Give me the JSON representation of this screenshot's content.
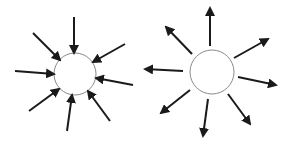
{
  "diagram": {
    "colors": {
      "arrow": "#1a1a1a",
      "circle_stroke": "#8a8a8a",
      "background": "#ffffff"
    },
    "panels": [
      {
        "name": "inward-converging",
        "circle": {
          "cx": 75,
          "cy": 74,
          "r": 21
        },
        "direction": "inward",
        "arrows": [
          {
            "x1": 74,
            "y1": 17,
            "x2": 74,
            "y2": 53
          },
          {
            "x1": 33,
            "y1": 33,
            "x2": 60,
            "y2": 60
          },
          {
            "x1": 125,
            "y1": 44,
            "x2": 93,
            "y2": 62
          },
          {
            "x1": 15,
            "y1": 71,
            "x2": 54,
            "y2": 74
          },
          {
            "x1": 133,
            "y1": 85,
            "x2": 96,
            "y2": 78
          },
          {
            "x1": 29,
            "y1": 111,
            "x2": 59,
            "y2": 89
          },
          {
            "x1": 67,
            "y1": 131,
            "x2": 72,
            "y2": 95
          },
          {
            "x1": 110,
            "y1": 121,
            "x2": 88,
            "y2": 91
          }
        ]
      },
      {
        "name": "outward-diverging",
        "circle": {
          "cx": 212,
          "cy": 72,
          "r": 22
        },
        "direction": "outward",
        "arrows": [
          {
            "x1": 210,
            "y1": 46,
            "x2": 210,
            "y2": 8
          },
          {
            "x1": 192,
            "y1": 54,
            "x2": 166,
            "y2": 27
          },
          {
            "x1": 234,
            "y1": 58,
            "x2": 268,
            "y2": 39
          },
          {
            "x1": 183,
            "y1": 71,
            "x2": 145,
            "y2": 69
          },
          {
            "x1": 238,
            "y1": 77,
            "x2": 276,
            "y2": 85
          },
          {
            "x1": 190,
            "y1": 90,
            "x2": 161,
            "y2": 113
          },
          {
            "x1": 208,
            "y1": 99,
            "x2": 203,
            "y2": 136
          },
          {
            "x1": 228,
            "y1": 94,
            "x2": 250,
            "y2": 124
          }
        ]
      }
    ]
  }
}
